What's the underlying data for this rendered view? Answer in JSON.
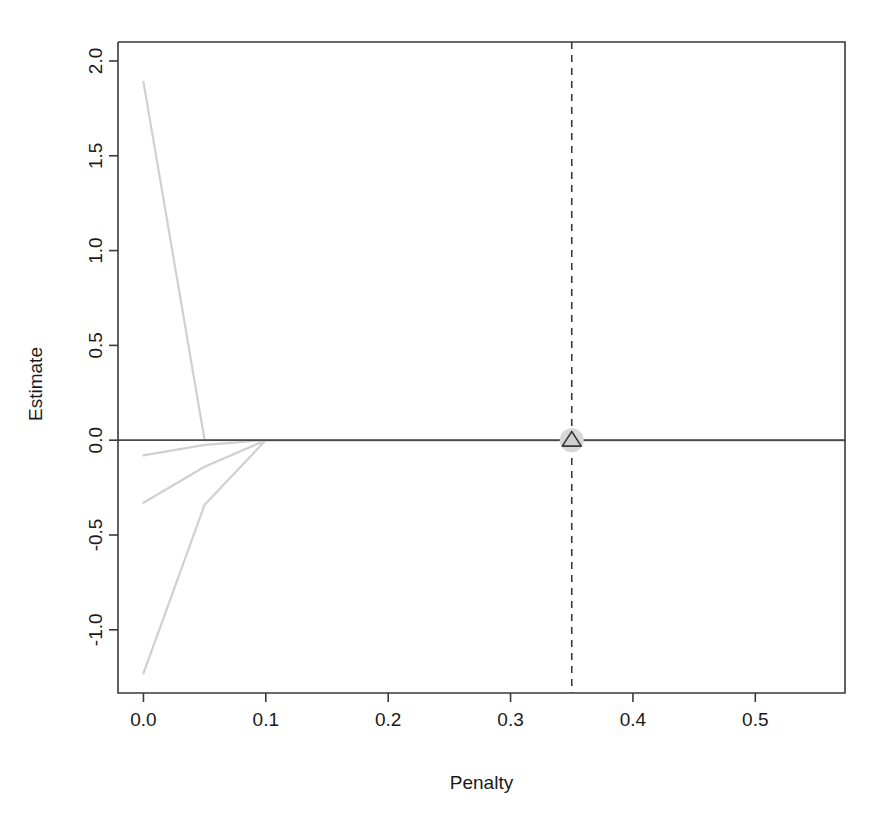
{
  "chart_data": {
    "type": "line",
    "title": "",
    "subtitle": "",
    "xlabel": "Penalty",
    "ylabel": "Estimate",
    "xlim": [
      -0.0208,
      0.5733
    ],
    "ylim": [
      -1.3333,
      2.1
    ],
    "grid": false,
    "legend": false,
    "legend_position": "none",
    "xticks": [
      0.0,
      0.1,
      0.2,
      0.3,
      0.4,
      0.5
    ],
    "xtick_labels": [
      "0.0",
      "0.1",
      "0.2",
      "0.3",
      "0.4",
      "0.5"
    ],
    "yticks": [
      -1.0,
      -0.5,
      0.0,
      0.5,
      1.0,
      1.5,
      2.0
    ],
    "ytick_labels": [
      "-1.0",
      "-0.5",
      "0.0",
      "0.5",
      "1.0",
      "1.5",
      "2.0"
    ],
    "line_color": "#d0d0d0",
    "axis_color": "#3a3a3a",
    "series": [
      {
        "name": "coef-path-1",
        "x": [
          0.0,
          0.05,
          0.1,
          0.15,
          0.2,
          0.25,
          0.3,
          0.35,
          0.4,
          0.45,
          0.5,
          0.5733
        ],
        "values": [
          1.89,
          0.0,
          0.0,
          0.0,
          0.0,
          0.0,
          0.0,
          0.0,
          0.0,
          0.0,
          0.0,
          0.0
        ]
      },
      {
        "name": "coef-path-2",
        "x": [
          0.0,
          0.05,
          0.1,
          0.15,
          0.2,
          0.25,
          0.3,
          0.35,
          0.4,
          0.45,
          0.5,
          0.5733
        ],
        "values": [
          -0.08,
          -0.025,
          0.0,
          0.0,
          0.0,
          0.0,
          0.0,
          0.0,
          0.0,
          0.0,
          0.0,
          0.0
        ]
      },
      {
        "name": "coef-path-3",
        "x": [
          0.0,
          0.05,
          0.1,
          0.15,
          0.2,
          0.25,
          0.3,
          0.35,
          0.4,
          0.45,
          0.5,
          0.5733
        ],
        "values": [
          -0.33,
          -0.14,
          0.0,
          0.0,
          0.0,
          0.0,
          0.0,
          0.0,
          0.0,
          0.0,
          0.0,
          0.0
        ]
      },
      {
        "name": "coef-path-4",
        "x": [
          0.0,
          0.05,
          0.1,
          0.15,
          0.2,
          0.25,
          0.3,
          0.35,
          0.4,
          0.45,
          0.5,
          0.5733
        ],
        "values": [
          -1.23,
          -0.34,
          0.0,
          0.0,
          0.0,
          0.0,
          0.0,
          0.0,
          0.0,
          0.0,
          0.0,
          0.0
        ]
      }
    ],
    "annotations": [
      {
        "name": "selected-penalty-line",
        "type": "vline",
        "x": 0.35,
        "style": "dashed",
        "color": "#3a3a3a"
      },
      {
        "name": "zero-reference-line",
        "type": "hline",
        "y": 0.0,
        "style": "solid",
        "color": "#4a4a4a"
      },
      {
        "name": "selected-point-marker",
        "type": "triangle",
        "x": 0.35,
        "y": 0.0,
        "fill": "#cfcfcf",
        "edge": "#3a3a3a"
      }
    ]
  }
}
